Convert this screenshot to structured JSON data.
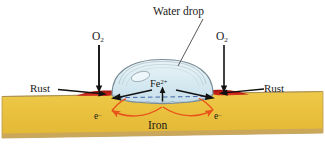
{
  "figure": {
    "colors": {
      "iron_fill": "#e9bc3f",
      "iron_fill_light": "#efc94c",
      "iron_edge": "#b99a55",
      "iron_bottom_edge": "#c9a96a",
      "drop_fill_top": "#dfeef3",
      "drop_fill_bottom": "#cfe4ec",
      "drop_outline": "#7a8b95",
      "rust_red": "#cc1f1f",
      "rust_red_dark": "#9e1414",
      "electron_arrow": "#e8541b",
      "waterline_dash": "#2b4f9e",
      "arrow_black": "#111111",
      "text": "#1a1a1a",
      "background": "#ffffff"
    }
  },
  "labels": {
    "water_drop": "Water drop",
    "oxygen_left": "O",
    "oxygen_left_sub": "2",
    "oxygen_right": "O",
    "oxygen_right_sub": "2",
    "rust_left": "Rust",
    "rust_right": "Rust",
    "iron": "Iron",
    "ferrous_ion": "Fe",
    "ferrous_ion_sup": "2+",
    "electron_left": "e",
    "electron_left_sup": "−",
    "electron_right": "e",
    "electron_right_sup": "−"
  },
  "annotations": {
    "leader_water_drop": "leader line from Water drop label to drop surface",
    "arrow_o2_left": "downward arrow from O2 to left rust site",
    "arrow_o2_right": "downward arrow from O2 to right rust site",
    "arrow_rust_left": "arrow from Rust label to left rust deposit",
    "arrow_rust_right": "arrow from Rust label to right rust deposit",
    "arrow_fe_left": "arrow from Fe2+ to left rust site",
    "arrow_fe_right": "arrow from Fe2+ to right rust site",
    "arrow_fe_up": "upward arrow from iron surface to Fe2+",
    "electron_flow_left": "curved arrow showing electron flow toward left site",
    "electron_flow_right": "curved arrow showing electron flow toward right site",
    "waterline": "dashed line marking drop base"
  }
}
